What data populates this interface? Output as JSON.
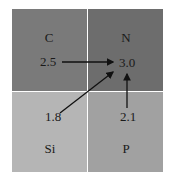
{
  "diagram": {
    "cells": [
      {
        "element": "C",
        "value": "2.5",
        "color": "#7a7a7a"
      },
      {
        "element": "N",
        "value": "3.0",
        "color": "#6d6d6d"
      },
      {
        "element": "Si",
        "value": "1.8",
        "color": "#b5b5b5"
      },
      {
        "element": "P",
        "value": "2.1",
        "color": "#a1a1a1"
      }
    ],
    "arrows": [
      {
        "from": "C",
        "to": "N"
      },
      {
        "from": "Si",
        "to": "N"
      },
      {
        "from": "P",
        "to": "N"
      }
    ],
    "divider_color": "#ffffff"
  }
}
